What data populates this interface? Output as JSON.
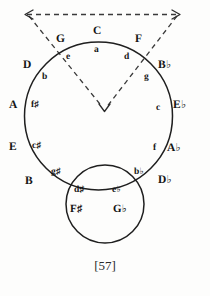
{
  "figure": {
    "page_number": "[57]"
  },
  "colors": {
    "ink": "#141414",
    "line": "#1f1f1f",
    "dashed": "#3a3a3a",
    "background": "#fdfdfc"
  },
  "circle_of_fifths": {
    "major_keys": [
      {
        "label": "C",
        "accidental": "",
        "x": 99,
        "y": 32,
        "angle_deg": 0
      },
      {
        "label": "G",
        "accidental": "",
        "x": 61,
        "y": 40,
        "angle_deg": 30
      },
      {
        "label": "D",
        "accidental": "",
        "x": 31,
        "y": 66,
        "angle_deg": 60
      },
      {
        "label": "A",
        "accidental": "",
        "x": 14,
        "y": 105,
        "angle_deg": 90
      },
      {
        "label": "E",
        "accidental": "",
        "x": 14,
        "y": 147,
        "angle_deg": 120
      },
      {
        "label": "B",
        "accidental": "",
        "x": 31,
        "y": 181,
        "angle_deg": 150
      },
      {
        "label": "F",
        "accidental": "♯",
        "x": 76,
        "y": 209,
        "angle_deg": 180
      },
      {
        "label": "G",
        "accidental": "♭",
        "x": 118,
        "y": 209,
        "angle_deg": 180
      },
      {
        "label": "D",
        "accidental": "♭",
        "x": 163,
        "y": 180,
        "angle_deg": 210
      },
      {
        "label": "A",
        "accidental": "♭",
        "x": 172,
        "y": 148,
        "angle_deg": 240
      },
      {
        "label": "E",
        "accidental": "♭",
        "x": 178,
        "y": 105,
        "angle_deg": 270
      },
      {
        "label": "B",
        "accidental": "♭",
        "x": 163,
        "y": 66,
        "angle_deg": 300
      },
      {
        "label": "F",
        "accidental": "",
        "x": 139,
        "y": 40,
        "angle_deg": 330
      }
    ],
    "minor_keys": [
      {
        "label": "a",
        "accidental": "",
        "x": 96,
        "y": 50,
        "relative_of": "C"
      },
      {
        "label": "e",
        "accidental": "",
        "x": 69,
        "y": 57,
        "relative_of": "G"
      },
      {
        "label": "b",
        "accidental": "",
        "x": 45,
        "y": 77,
        "relative_of": "D"
      },
      {
        "label": "f",
        "accidental": "♯",
        "x": 35,
        "y": 105,
        "relative_of": "A"
      },
      {
        "label": "c",
        "accidental": "♯",
        "x": 36,
        "y": 146,
        "relative_of": "E"
      },
      {
        "label": "g",
        "accidental": "♯",
        "x": 55,
        "y": 172,
        "relative_of": "B"
      },
      {
        "label": "d",
        "accidental": "♯",
        "x": 78,
        "y": 190,
        "relative_of": "F♯"
      },
      {
        "label": "e",
        "accidental": "♭",
        "x": 116,
        "y": 190,
        "relative_of": "G♭"
      },
      {
        "label": "b",
        "accidental": "♭",
        "x": 137,
        "y": 172,
        "relative_of": "D♭"
      },
      {
        "label": "f",
        "accidental": "",
        "x": 155,
        "y": 148,
        "relative_of": "A♭"
      },
      {
        "label": "c",
        "accidental": "",
        "x": 158,
        "y": 108,
        "relative_of": "E♭"
      },
      {
        "label": "g",
        "accidental": "",
        "x": 147,
        "y": 77,
        "relative_of": "B♭"
      },
      {
        "label": "d",
        "accidental": "",
        "x": 127,
        "y": 57,
        "relative_of": "F"
      }
    ]
  },
  "geometry": {
    "main_circle": {
      "cx": 98.5,
      "cy": 116,
      "r": 74
    },
    "small_circle": {
      "cx": 105,
      "cy": 204,
      "r": 39
    },
    "dashed_top_line": {
      "x1": 26,
      "y1": 14,
      "x2": 180,
      "y2": 14
    },
    "dashed_left_ray": {
      "x1": 28,
      "y1": 15,
      "x2": 101,
      "y2": 107
    },
    "dashed_right_ray": {
      "x1": 178,
      "y1": 15,
      "x2": 107,
      "y2": 107
    }
  }
}
